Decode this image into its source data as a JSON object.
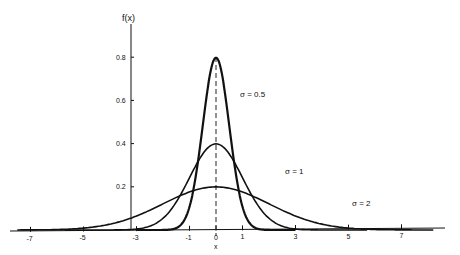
{
  "chart_data": {
    "type": "line",
    "title": "",
    "xlabel": "x",
    "ylabel": "f(x)",
    "xlim": [
      -7.5,
      8.2
    ],
    "ylim": [
      0,
      0.85
    ],
    "grid": false,
    "legend_position": "inline annotations",
    "x_ticks": [
      -7,
      -5,
      -3,
      -1,
      0,
      1,
      3,
      5,
      7
    ],
    "x_tick_labels": [
      "-7",
      "-5",
      "-3",
      "-1",
      "0",
      "1",
      "3",
      "5",
      "7"
    ],
    "y_ticks": [
      0.2,
      0.4,
      0.6,
      0.8
    ],
    "y_tick_labels": [
      "0.2",
      "0.4",
      "0.6",
      "0.8"
    ],
    "series": [
      {
        "name": "σ = 0.5",
        "mean": 0,
        "sigma": 0.5,
        "x_range": [
          -3,
          3
        ],
        "peak": 0.798,
        "x": [
          -3,
          -2,
          -1.5,
          -1,
          -0.5,
          0,
          0.5,
          1,
          1.5,
          2,
          3
        ],
        "values": [
          0.0,
          0.0001,
          0.0089,
          0.108,
          0.484,
          0.798,
          0.484,
          0.108,
          0.0089,
          0.0001,
          0.0
        ]
      },
      {
        "name": "σ = 1",
        "mean": 0,
        "sigma": 1,
        "x_range": [
          -5.7,
          5.7
        ],
        "peak": 0.399,
        "x": [
          -5,
          -4,
          -3,
          -2,
          -1,
          0,
          1,
          2,
          3,
          4,
          5
        ],
        "values": [
          0.0,
          0.0001,
          0.0044,
          0.054,
          0.242,
          0.399,
          0.242,
          0.054,
          0.0044,
          0.0001,
          0.0
        ]
      },
      {
        "name": "σ = 2",
        "mean": 0,
        "sigma": 2,
        "x_range": [
          -7.5,
          8.2
        ],
        "peak": 0.199,
        "x": [
          -7,
          -5,
          -3,
          -1,
          0,
          1,
          3,
          5,
          7
        ],
        "values": [
          0.0044,
          0.0175,
          0.0648,
          0.176,
          0.199,
          0.176,
          0.0648,
          0.0175,
          0.0044
        ]
      }
    ],
    "annotations": [
      {
        "text": "σ = 0.5",
        "near_x": 1.3,
        "near_y": 0.52
      },
      {
        "text": "σ = 1",
        "near_x": 2.6,
        "near_y": 0.25
      },
      {
        "text": "σ = 2",
        "near_x": 4.8,
        "near_y": 0.06
      }
    ],
    "mean_line": {
      "x": 0,
      "style": "dashed",
      "label": "x"
    }
  },
  "labels": {
    "y_axis_title": "f(x)",
    "x_axis_title": "x",
    "sigma_05": "σ = 0.5",
    "sigma_1": "σ = 1",
    "sigma_2": "σ = 2"
  },
  "colors": {
    "ink": "#111111",
    "background": "#ffffff"
  }
}
